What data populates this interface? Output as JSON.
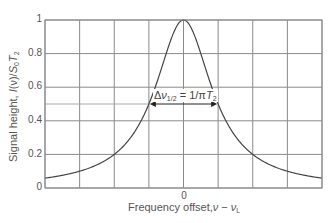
{
  "chart_data": {
    "type": "line",
    "title": "",
    "xlabel": "Frequency offset, ν − ν_L",
    "ylabel": "Signal height, I(ν)/S₀T₂",
    "xlim": [
      -4,
      4
    ],
    "ylim": [
      0,
      1
    ],
    "x_tick_labels": [
      "0"
    ],
    "y_tick_labels": [
      "0",
      "0.2",
      "0.4",
      "0.6",
      "0.8",
      "1"
    ],
    "y_ticks": [
      0,
      0.2,
      0.4,
      0.6,
      0.8,
      1
    ],
    "x_grid_positions": [
      -4,
      -3,
      -2,
      -1,
      0,
      1,
      2,
      3,
      4
    ],
    "grid": true,
    "legend": null,
    "series": [
      {
        "name": "Lorentzian lineshape",
        "function": "1/(1+x^2)",
        "x": [
          -4,
          -3,
          -2,
          -1.5,
          -1,
          -0.5,
          0,
          0.5,
          1,
          1.5,
          2,
          3,
          4
        ],
        "values": [
          0.059,
          0.1,
          0.2,
          0.308,
          0.5,
          0.8,
          1.0,
          0.8,
          0.5,
          0.308,
          0.2,
          0.1,
          0.059
        ]
      }
    ],
    "annotations": [
      {
        "text": "Δν_1/2 = 1/πT₂",
        "type": "double-arrow",
        "x_from": -1,
        "x_to": 1,
        "y": 0.5
      },
      {
        "type": "reference-line",
        "y": 0.5,
        "x_from": -4,
        "x_to": -1
      }
    ]
  },
  "labels": {
    "xlabel_text": "Frequency offset,",
    "xlabel_nu": "ν",
    "xlabel_minus": " − ",
    "xlabel_nuL": "ν",
    "xlabel_sub": "L",
    "ylabel_text": "Signal height, ",
    "ylabel_I": "I",
    "ylabel_nu": "(ν)/",
    "ylabel_S": "S",
    "ylabel_S_sub": "0",
    "ylabel_T": "T",
    "ylabel_T_sub": "2",
    "annot_delta": "Δ",
    "annot_nu": "ν",
    "annot_sub": "1/2",
    "annot_eq": " = 1/π",
    "annot_T": "T",
    "annot_T_sub": "2",
    "x_zero": "0",
    "y0": "0",
    "y02": "0.2",
    "y04": "0.4",
    "y06": "0.6",
    "y08": "0.8",
    "y1": "1"
  },
  "colors": {
    "grid": "#8a8a8a",
    "curve": "#444444",
    "halfline": "#aaaaaa",
    "text": "#555555"
  }
}
